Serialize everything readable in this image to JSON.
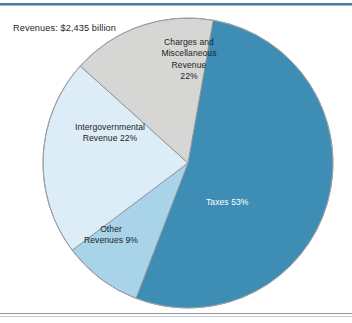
{
  "figure": {
    "title": "Revenues: $2,435 billion"
  },
  "chart_data": {
    "type": "pie",
    "title": "Revenues: $2,435 billion",
    "total_label": "$2,435 billion",
    "total_value": 2435,
    "units": "billions of dollars",
    "xlabel": "",
    "ylabel": "",
    "grid": false,
    "legend": "none",
    "labels_position": "inside-slice",
    "start_angle_deg": 10,
    "direction": "clockwise",
    "categories": [
      "Taxes",
      "Other Revenues",
      "Intergovernmental Revenue",
      "Charges and Miscellaneous Revenue"
    ],
    "values": [
      53,
      9,
      22,
      22
    ],
    "slices": [
      {
        "name": "Taxes",
        "value": 53,
        "label": "Taxes 53%",
        "label_lines": [
          "Taxes 53%"
        ],
        "color": "#3d8db5",
        "text_color": "#ffffff",
        "start_deg": 10,
        "sweep_deg": 191
      },
      {
        "name": "Other Revenues",
        "value": 9,
        "label": "Other Revenues 9%",
        "label_lines": [
          "Other",
          "Revenues 9%"
        ],
        "color": "#a8d3e8",
        "text_color": "#1d2326",
        "start_deg": 201,
        "sweep_deg": 32
      },
      {
        "name": "Intergovernmental Revenue",
        "value": 22,
        "label": "Intergovernmental Revenue 22%",
        "label_lines": [
          "Intergovernmental",
          "Revenue 22%"
        ],
        "color": "#dcedf7",
        "text_color": "#1d2326",
        "start_deg": 233,
        "sweep_deg": 79
      },
      {
        "name": "Charges and Miscellaneous Revenue",
        "value": 22,
        "label": "Charges and Miscellaneous Revenue 22%",
        "label_lines": [
          "Charges and",
          "Miscellaneous",
          "Revenue",
          "22%"
        ],
        "color": "#d6d6d4",
        "text_color": "#1d2326",
        "start_deg": 312,
        "sweep_deg": 58
      }
    ]
  },
  "labels": {
    "charges": "Charges and\nMiscellaneous\nRevenue\n22%",
    "intergovernmental": "Intergovernmental\nRevenue 22%",
    "other": "Other\nRevenues 9%",
    "taxes": "Taxes 53%"
  },
  "colors": {
    "taxes": "#3d8db5",
    "other_revenues": "#a8d3e8",
    "intergovernmental": "#dcedf7",
    "charges_misc": "#d6d6d4",
    "slice_outline": "#8a9298",
    "rule_top": "#4a7f9c",
    "rule_bottom": "#8d9aa3",
    "background": "#ffffff",
    "text": "#1d2326"
  }
}
